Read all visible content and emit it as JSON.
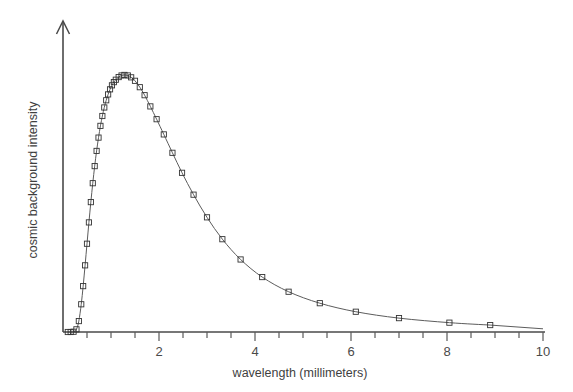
{
  "chart_data": {
    "type": "line",
    "title": "",
    "xlabel": "wavelength (millimeters)",
    "ylabel": "cosmic background intensity",
    "xlim": [
      0,
      10
    ],
    "ylim": [
      0,
      1.08
    ],
    "grid": false,
    "legend": null,
    "x_tick_labels": [
      "2",
      "4",
      "6",
      "8",
      "10"
    ],
    "x_tick_values": [
      2,
      4,
      6,
      8,
      10
    ],
    "x_minor_tick_step": 0.5,
    "y_tick_labels": [],
    "marker": "open-square",
    "marker_color": "#333333",
    "line_color": "#5c5c5c",
    "axis_color": "#4a4a4a",
    "y_axis_has_arrow": true,
    "series": [
      {
        "name": "cosmic background intensity",
        "x": [
          0.1,
          0.16,
          0.22,
          0.28,
          0.33,
          0.38,
          0.42,
          0.46,
          0.5,
          0.54,
          0.58,
          0.62,
          0.66,
          0.7,
          0.74,
          0.78,
          0.82,
          0.86,
          0.9,
          0.94,
          0.98,
          1.02,
          1.06,
          1.1,
          1.16,
          1.22,
          1.28,
          1.35,
          1.42,
          1.5,
          1.6,
          1.7,
          1.82,
          1.95,
          2.1,
          2.28,
          2.48,
          2.72,
          3.0,
          3.32,
          3.7,
          4.15,
          4.7,
          5.35,
          6.1,
          7.0,
          8.05,
          8.9
        ],
        "y": [
          0.0,
          0.0,
          0.001,
          0.01,
          0.041,
          0.104,
          0.172,
          0.25,
          0.331,
          0.411,
          0.487,
          0.558,
          0.622,
          0.679,
          0.729,
          0.773,
          0.81,
          0.842,
          0.869,
          0.891,
          0.91,
          0.925,
          0.937,
          0.946,
          0.956,
          0.962,
          0.964,
          0.962,
          0.955,
          0.942,
          0.918,
          0.888,
          0.846,
          0.798,
          0.741,
          0.672,
          0.597,
          0.515,
          0.43,
          0.348,
          0.272,
          0.206,
          0.151,
          0.108,
          0.076,
          0.052,
          0.035,
          0.026
        ]
      }
    ]
  },
  "axes": {
    "x_axis_label": "wavelength (millimeters)",
    "y_axis_label": "cosmic background intensity"
  }
}
